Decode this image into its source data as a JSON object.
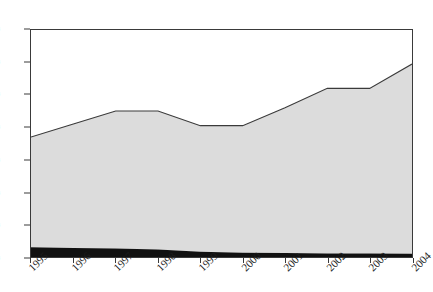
{
  "chart_data": {
    "type": "area",
    "title": "",
    "subtitle": "",
    "xlabel": "",
    "ylabel": "",
    "categories": [
      "1995",
      "1996",
      "1997",
      "1998",
      "1999",
      "2000",
      "2001",
      "2002",
      "2003",
      "2004"
    ],
    "x": [
      1995,
      1996,
      1997,
      1998,
      1999,
      2000,
      2001,
      2002,
      2003,
      2004
    ],
    "ylim": [
      0,
      70
    ],
    "xlim": [
      1995,
      2004
    ],
    "yticks": [
      0,
      10,
      20,
      30,
      40,
      50,
      60,
      70
    ],
    "grid": false,
    "legend": "none",
    "stacked": true,
    "series": [
      {
        "name": "lower-band",
        "color": "#111111",
        "values": [
          3,
          2.8,
          2.6,
          2.3,
          1.6,
          1.3,
          1.2,
          1.1,
          1.1,
          1.0
        ]
      },
      {
        "name": "upper-band",
        "color": "#dcdcdc",
        "values": [
          34,
          38.2,
          42.4,
          42.7,
          38.9,
          39.2,
          44.8,
          50.9,
          50.9,
          58.5
        ]
      }
    ],
    "totals": [
      37,
      41,
      45,
      45,
      40.5,
      40.5,
      46,
      52,
      52,
      59.5
    ],
    "axis_color": "#3a3a3a",
    "line_color": "#3a3a3a",
    "background": "#ffffff"
  },
  "axes": {
    "y_tick_labels": [
      "70",
      "60",
      "50",
      "40",
      "30",
      "20",
      "10",
      "0"
    ],
    "x_tick_labels": [
      "1995",
      "1996",
      "1997",
      "1998",
      "1999",
      "2000",
      "2001",
      "2002",
      "2003",
      "2004"
    ]
  }
}
